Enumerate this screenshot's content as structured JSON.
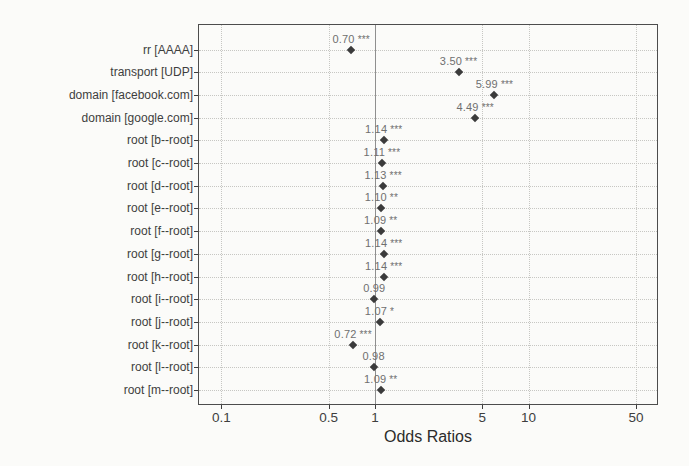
{
  "chart_data": {
    "type": "scatter",
    "variant": "forest-odds-ratio-dot-plot",
    "title": "",
    "xlabel": "Odds Ratios",
    "ylabel": "",
    "x_scale": "log10",
    "x_ticks": [
      {
        "value": 0.1,
        "label": "0.1"
      },
      {
        "value": 0.5,
        "label": "0.5"
      },
      {
        "value": 1,
        "label": "1"
      },
      {
        "value": 5,
        "label": "5"
      },
      {
        "value": 10,
        "label": "10"
      },
      {
        "value": 50,
        "label": "50"
      }
    ],
    "x_range": [
      0.0715,
      68.5
    ],
    "reference_line_x": 1,
    "grid": "dotted",
    "legend": "none",
    "categories": [
      "rr [AAAA]",
      "transport [UDP]",
      "domain [facebook.com]",
      "domain [google.com]",
      "root [b--root]",
      "root [c--root]",
      "root [d--root]",
      "root [e--root]",
      "root [f--root]",
      "root [g--root]",
      "root [h--root]",
      "root [i--root]",
      "root [j--root]",
      "root [k--root]",
      "root [l--root]",
      "root [m--root]"
    ],
    "rows": [
      {
        "label": "rr [AAAA]",
        "value": 0.7,
        "display": "0.70",
        "stars": "***"
      },
      {
        "label": "transport [UDP]",
        "value": 3.5,
        "display": "3.50",
        "stars": "***"
      },
      {
        "label": "domain [facebook.com]",
        "value": 5.99,
        "display": "5.99",
        "stars": "***"
      },
      {
        "label": "domain [google.com]",
        "value": 4.49,
        "display": "4.49",
        "stars": "***"
      },
      {
        "label": "root [b--root]",
        "value": 1.14,
        "display": "1.14",
        "stars": "***"
      },
      {
        "label": "root [c--root]",
        "value": 1.11,
        "display": "1.11",
        "stars": "***"
      },
      {
        "label": "root [d--root]",
        "value": 1.13,
        "display": "1.13",
        "stars": "***"
      },
      {
        "label": "root [e--root]",
        "value": 1.1,
        "display": "1.10",
        "stars": "**"
      },
      {
        "label": "root [f--root]",
        "value": 1.09,
        "display": "1.09",
        "stars": "**"
      },
      {
        "label": "root [g--root]",
        "value": 1.14,
        "display": "1.14",
        "stars": "***"
      },
      {
        "label": "root [h--root]",
        "value": 1.14,
        "display": "1.14",
        "stars": "***"
      },
      {
        "label": "root [i--root]",
        "value": 0.99,
        "display": "0.99",
        "stars": ""
      },
      {
        "label": "root [j--root]",
        "value": 1.07,
        "display": "1.07",
        "stars": "*"
      },
      {
        "label": "root [k--root]",
        "value": 0.72,
        "display": "0.72",
        "stars": "***"
      },
      {
        "label": "root [l--root]",
        "value": 0.98,
        "display": "0.98",
        "stars": ""
      },
      {
        "label": "root [m--root]",
        "value": 1.09,
        "display": "1.09",
        "stars": "**"
      }
    ],
    "colors": {
      "background": "#fbfbf9",
      "panel_border": "#4d4d4d",
      "gridline": "#c7c7c3",
      "reference_line": "#8f8f8f",
      "point": "#3b3b3b",
      "value_label": "#6f6f6f",
      "axis_text": "#3e3e3e",
      "axis_title": "#2b2b2b"
    },
    "layout": {
      "panel_left": 199,
      "panel_top": 25,
      "panel_width": 458,
      "panel_height": 379,
      "row_first_y": 24.5,
      "row_spacing": 22.7,
      "x_tick_label_y": 410,
      "x_axis_title_y": 428
    }
  }
}
